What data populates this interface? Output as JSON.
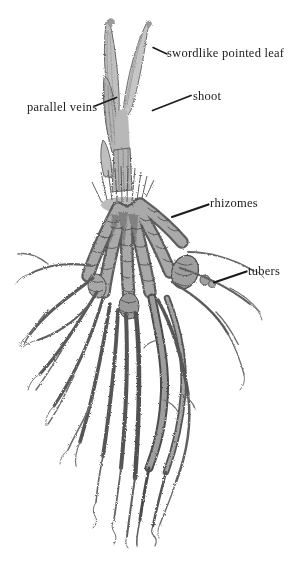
{
  "colors": {
    "background": "#ffffff",
    "ink": "#1b1b1b",
    "pencil_light": "#c6c6c6",
    "pencil_mid": "#8f8f8f",
    "pencil_dark": "#4e4e4e"
  },
  "labels": {
    "swordlike_pointed_leaf": "swordlike pointed leaf",
    "shoot": "shoot",
    "parallel_veins": "parallel veins",
    "rhizomes": "rhizomes",
    "tubers": "tubers"
  }
}
